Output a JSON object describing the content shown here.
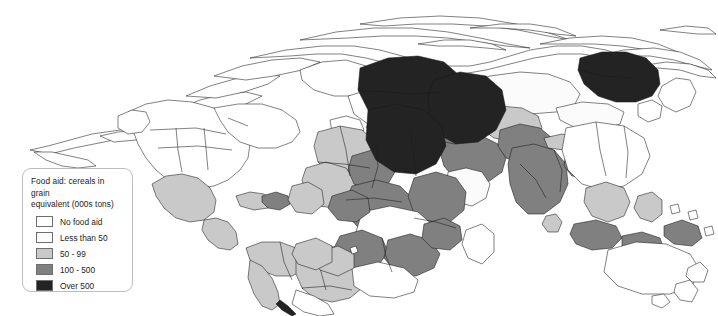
{
  "legend": {
    "title_line1": "Food aid: cereals in grain",
    "title_line2": "equivalent (000s tons)",
    "items": [
      {
        "label": "No food aid",
        "color": "#ffffff"
      },
      {
        "label": "Less than 50",
        "color": "#fbfbfb"
      },
      {
        "label": "50 - 99",
        "color": "#c9c9c9"
      },
      {
        "label": "100 - 500",
        "color": "#808080"
      },
      {
        "label": "Over 500",
        "color": "#232323"
      }
    ]
  },
  "map": {
    "type": "cartogram",
    "projection": "area-distorted world cartogram",
    "outline_color": "#1a1a1a",
    "background": "#ffffff",
    "regions": [
      {
        "name": "north-america",
        "class": "No food aid",
        "fill": "#ffffff"
      },
      {
        "name": "mexico",
        "class": "50 - 99",
        "fill": "#c9c9c9"
      },
      {
        "name": "central-america-caribbean",
        "class": "50 - 99",
        "fill": "#c9c9c9"
      },
      {
        "name": "haiti",
        "class": "100 - 500",
        "fill": "#808080"
      },
      {
        "name": "south-america-north",
        "class": "50 - 99",
        "fill": "#c9c9c9"
      },
      {
        "name": "brazil",
        "class": "50 - 99",
        "fill": "#c9c9c9"
      },
      {
        "name": "southern-cone",
        "class": "No food aid",
        "fill": "#ffffff"
      },
      {
        "name": "western-europe",
        "class": "No food aid",
        "fill": "#ffffff"
      },
      {
        "name": "eastern-europe",
        "class": "Less than 50",
        "fill": "#fbfbfb"
      },
      {
        "name": "balkans",
        "class": "100 - 500",
        "fill": "#808080"
      },
      {
        "name": "west-africa",
        "class": "50 - 99",
        "fill": "#c9c9c9"
      },
      {
        "name": "sahel",
        "class": "100 - 500",
        "fill": "#808080"
      },
      {
        "name": "horn-of-africa",
        "class": "Over 500",
        "fill": "#232323"
      },
      {
        "name": "sudan",
        "class": "Over 500",
        "fill": "#232323"
      },
      {
        "name": "central-africa",
        "class": "100 - 500",
        "fill": "#808080"
      },
      {
        "name": "east-africa",
        "class": "100 - 500",
        "fill": "#808080"
      },
      {
        "name": "southern-africa",
        "class": "100 - 500",
        "fill": "#808080"
      },
      {
        "name": "angola",
        "class": "100 - 500",
        "fill": "#808080"
      },
      {
        "name": "south-africa",
        "class": "No food aid",
        "fill": "#ffffff"
      },
      {
        "name": "middle-east",
        "class": "100 - 500",
        "fill": "#808080"
      },
      {
        "name": "central-asia",
        "class": "50 - 99",
        "fill": "#c9c9c9"
      },
      {
        "name": "afghanistan-pakistan",
        "class": "100 - 500",
        "fill": "#808080"
      },
      {
        "name": "india",
        "class": "100 - 500",
        "fill": "#808080"
      },
      {
        "name": "bangladesh",
        "class": "100 - 500",
        "fill": "#808080"
      },
      {
        "name": "russia",
        "class": "Less than 50",
        "fill": "#fbfbfb"
      },
      {
        "name": "china",
        "class": "No food aid",
        "fill": "#ffffff"
      },
      {
        "name": "mongolia",
        "class": "Less than 50",
        "fill": "#fbfbfb"
      },
      {
        "name": "north-korea",
        "class": "Over 500",
        "fill": "#232323"
      },
      {
        "name": "southeast-asia",
        "class": "50 - 99",
        "fill": "#c9c9c9"
      },
      {
        "name": "indonesia",
        "class": "100 - 500",
        "fill": "#808080"
      },
      {
        "name": "philippines",
        "class": "50 - 99",
        "fill": "#c9c9c9"
      },
      {
        "name": "papua-new-guinea",
        "class": "100 - 500",
        "fill": "#808080"
      },
      {
        "name": "australia",
        "class": "No food aid",
        "fill": "#ffffff"
      },
      {
        "name": "new-zealand",
        "class": "No food aid",
        "fill": "#ffffff"
      }
    ]
  }
}
